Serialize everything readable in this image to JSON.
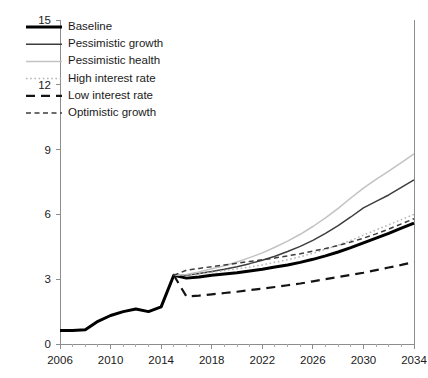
{
  "chart_data": {
    "type": "line",
    "title": "",
    "subtitle": "",
    "xlabel": "",
    "ylabel": "",
    "xlim": [
      2006,
      2034
    ],
    "ylim": [
      0,
      15
    ],
    "grid": false,
    "legend_position": "top-left",
    "x_ticks": [
      2006,
      2010,
      2014,
      2018,
      2022,
      2026,
      2030,
      2034
    ],
    "x_tick_labels": [
      "2006",
      "2010",
      "2014",
      "2018",
      "2022",
      "2026",
      "2030",
      "2034"
    ],
    "x_minor_tick_step": 1,
    "y_ticks": [
      0,
      3,
      6,
      9,
      12,
      15
    ],
    "y_tick_labels": [
      "0",
      "3",
      "6",
      "9",
      "12",
      "15"
    ],
    "x": [
      2006,
      2007,
      2008,
      2009,
      2010,
      2011,
      2012,
      2013,
      2014,
      2015,
      2016,
      2017,
      2018,
      2019,
      2020,
      2021,
      2022,
      2023,
      2024,
      2025,
      2026,
      2027,
      2028,
      2029,
      2030,
      2031,
      2032,
      2033,
      2034
    ],
    "series": [
      {
        "name": "Baseline",
        "style": "solid",
        "color": "#000000",
        "width": 3.0,
        "values": [
          0.62,
          0.63,
          0.66,
          1.05,
          1.32,
          1.5,
          1.62,
          1.5,
          1.72,
          3.18,
          3.05,
          3.1,
          3.18,
          3.24,
          3.3,
          3.38,
          3.46,
          3.56,
          3.66,
          3.78,
          3.92,
          4.08,
          4.26,
          4.46,
          4.68,
          4.9,
          5.12,
          5.36,
          5.6
        ]
      },
      {
        "name": "Pessimistic growth",
        "style": "solid",
        "color": "#3d3d3d",
        "width": 1.5,
        "values": [
          null,
          null,
          null,
          null,
          null,
          null,
          null,
          null,
          null,
          3.18,
          3.18,
          3.26,
          3.36,
          3.46,
          3.58,
          3.72,
          3.88,
          4.06,
          4.28,
          4.52,
          4.8,
          5.12,
          5.48,
          5.88,
          6.3,
          6.6,
          6.9,
          7.25,
          7.6
        ]
      },
      {
        "name": "Pessimistic health",
        "style": "solid",
        "color": "#c2c2c2",
        "width": 1.5,
        "values": [
          null,
          null,
          null,
          null,
          null,
          null,
          null,
          null,
          null,
          3.18,
          3.22,
          3.34,
          3.48,
          3.62,
          3.8,
          4.0,
          4.22,
          4.48,
          4.76,
          5.08,
          5.44,
          5.84,
          6.28,
          6.76,
          7.22,
          7.62,
          8.0,
          8.4,
          8.8
        ]
      },
      {
        "name": "High interest rate",
        "style": "dotted",
        "color": "#b5b5b5",
        "width": 1.5,
        "values": [
          null,
          null,
          null,
          null,
          null,
          null,
          null,
          null,
          null,
          3.18,
          3.2,
          3.26,
          3.32,
          3.4,
          3.48,
          3.56,
          3.66,
          3.78,
          3.9,
          4.04,
          4.2,
          4.38,
          4.58,
          4.8,
          5.04,
          5.28,
          5.52,
          5.76,
          6.0
        ]
      },
      {
        "name": "Low interest rate",
        "style": "dashed-long",
        "color": "#141414",
        "width": 2.2,
        "values": [
          null,
          null,
          null,
          null,
          null,
          null,
          null,
          null,
          null,
          3.18,
          2.2,
          2.24,
          2.3,
          2.36,
          2.42,
          2.5,
          2.56,
          2.64,
          2.72,
          2.8,
          2.9,
          3.0,
          3.1,
          3.2,
          3.3,
          3.42,
          3.54,
          3.66,
          3.8
        ]
      },
      {
        "name": "Optimistic growth",
        "style": "dashed-short",
        "color": "#3d3d3d",
        "width": 1.5,
        "values": [
          null,
          null,
          null,
          null,
          null,
          null,
          null,
          null,
          null,
          3.18,
          3.42,
          3.5,
          3.58,
          3.66,
          3.74,
          3.82,
          3.9,
          3.98,
          4.08,
          4.18,
          4.3,
          4.42,
          4.56,
          4.72,
          4.9,
          5.1,
          5.32,
          5.56,
          5.8
        ]
      }
    ]
  },
  "legend": {
    "items": [
      {
        "label": "Baseline"
      },
      {
        "label": "Pessimistic growth"
      },
      {
        "label": "Pessimistic health"
      },
      {
        "label": "High interest rate"
      },
      {
        "label": "Low interest rate"
      },
      {
        "label": "Optimistic growth"
      }
    ]
  }
}
